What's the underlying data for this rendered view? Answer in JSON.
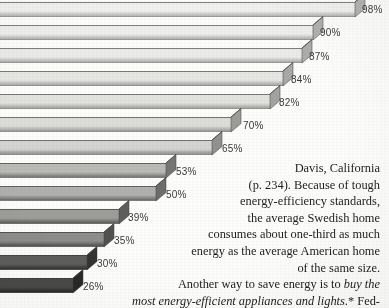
{
  "page": {
    "width": 389,
    "height": 308,
    "background_color": "#fcfcfb",
    "media": "scanned-book-page"
  },
  "chart_data": {
    "type": "bar",
    "orientation": "horizontal",
    "style": "3d-extruded-funnel",
    "title": "",
    "subtitle": "",
    "xlabel": "",
    "ylabel": "",
    "categories": [
      "",
      "",
      "",
      "",
      "",
      "",
      "",
      "",
      "",
      "",
      "",
      "",
      ""
    ],
    "values": [
      98,
      90,
      87,
      84,
      82,
      70,
      65,
      53,
      50,
      39,
      35,
      30,
      26
    ],
    "value_labels": [
      "98%",
      "90%",
      "87%",
      "84%",
      "82%",
      "70%",
      "65%",
      "53%",
      "50%",
      "39%",
      "35%",
      "30%",
      "26%"
    ],
    "xlim": [
      0,
      100
    ],
    "grid": false,
    "legend": false,
    "note": "Bars shade progressively darker from top (lightest) to bottom (darkest); each bar drawn with a 3-D extruded end cap."
  },
  "bars": [
    {
      "label": "98%",
      "value": 98,
      "top": 2,
      "height": 15,
      "end_x": 355,
      "face": "#f0f0ef",
      "cap": "#c9c9c6",
      "side": "#b3b3b0",
      "label_x": 362,
      "label_y": 4
    },
    {
      "label": "90%",
      "value": 90,
      "top": 25,
      "height": 15,
      "end_x": 313,
      "face": "#eeeeec",
      "cap": "#c6c6c3",
      "side": "#b0b0ad",
      "label_x": 320,
      "label_y": 27
    },
    {
      "label": "87%",
      "value": 87,
      "top": 48,
      "height": 15,
      "end_x": 302,
      "face": "#eaeae8",
      "cap": "#c2c2bf",
      "side": "#adadaa",
      "label_x": 309,
      "label_y": 51
    },
    {
      "label": "84%",
      "value": 84,
      "top": 71,
      "height": 15,
      "end_x": 283,
      "face": "#e6e6e3",
      "cap": "#bebebb",
      "side": "#a8a8a5",
      "label_x": 291,
      "label_y": 74
    },
    {
      "label": "82%",
      "value": 82,
      "top": 94,
      "height": 15,
      "end_x": 270,
      "face": "#e1e1de",
      "cap": "#b9b9b6",
      "side": "#a3a3a0",
      "label_x": 279,
      "label_y": 97
    },
    {
      "label": "70%",
      "value": 70,
      "top": 117,
      "height": 15,
      "end_x": 231,
      "face": "#dcdcd9",
      "cap": "#b2b2af",
      "side": "#9c9c99",
      "label_x": 243,
      "label_y": 120
    },
    {
      "label": "65%",
      "value": 65,
      "top": 140,
      "height": 15,
      "end_x": 212,
      "face": "#d4d4d0",
      "cap": "#a9a9a6",
      "side": "#919190",
      "label_x": 222,
      "label_y": 143
    },
    {
      "label": "53%",
      "value": 53,
      "top": 163,
      "height": 15,
      "end_x": 166,
      "face": "#b9b9b5",
      "cap": "#8e8e8b",
      "side": "#767674",
      "label_x": 176,
      "label_y": 166
    },
    {
      "label": "50%",
      "value": 50,
      "top": 186,
      "height": 15,
      "end_x": 156,
      "face": "#b0b0ac",
      "cap": "#858582",
      "side": "#6d6d6b",
      "label_x": 166,
      "label_y": 189
    },
    {
      "label": "39%",
      "value": 39,
      "top": 209,
      "height": 15,
      "end_x": 119,
      "face": "#9d9d99",
      "cap": "#767673",
      "side": "#5e5e5c",
      "label_x": 128,
      "label_y": 212
    },
    {
      "label": "35%",
      "value": 35,
      "top": 232,
      "height": 15,
      "end_x": 104,
      "face": "#8d8d8a",
      "cap": "#676765",
      "side": "#515150",
      "label_x": 114,
      "label_y": 235
    },
    {
      "label": "30%",
      "value": 30,
      "top": 255,
      "height": 15,
      "end_x": 87,
      "face": "#5e5e5c",
      "cap": "#474745",
      "side": "#333332",
      "label_x": 97,
      "label_y": 258
    },
    {
      "label": "26%",
      "value": 26,
      "top": 278,
      "height": 15,
      "end_x": 73,
      "face": "#4a4a48",
      "cap": "#393937",
      "side": "#282827",
      "label_x": 83,
      "label_y": 281
    }
  ],
  "text_column": {
    "paragraph_1_lines": [
      "Davis,  California",
      "(p. 234). Because of tough",
      "energy-efficiency standards,",
      "the  average  Swedish  home",
      "consumes  about  one-third  as  much",
      "energy as the average American home",
      "of the same size."
    ],
    "paragraph_2_line_1_plain": "Another way to save energy is to ",
    "paragraph_2_line_1_italic": "buy the",
    "paragraph_2_line_2_italic": "most energy-efficient appliances and lights.",
    "paragraph_2_line_2_plain": "* Fed-"
  }
}
